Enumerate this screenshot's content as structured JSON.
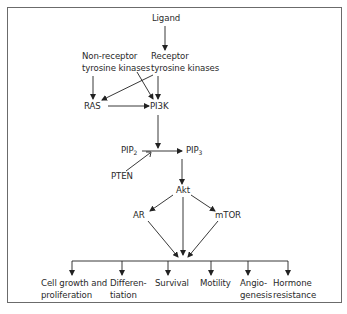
{
  "diagram": {
    "type": "signaling-pathway",
    "nodes": {
      "ligand": "Ligand",
      "non_receptor_tk": [
        "Non-receptor",
        "tyrosine kinases"
      ],
      "receptor_tk": [
        "Receptor",
        "tyrosine kinases"
      ],
      "ras": "RAS",
      "pi3k": "PI3K",
      "pip2": {
        "base": "PIP",
        "sub": "2"
      },
      "pip3": {
        "base": "PIP",
        "sub": "3"
      },
      "pten": "PTEN",
      "akt": "Akt",
      "ar": "AR",
      "mtor": "mTOR"
    },
    "outcomes": [
      {
        "line1": "Cell growth and",
        "line2": "proliferation"
      },
      {
        "line1": "Differen-",
        "line2": "tiation"
      },
      {
        "line1": "Survival",
        "line2": ""
      },
      {
        "line1": "Motility",
        "line2": ""
      },
      {
        "line1": "Angio-",
        "line2": "genesis"
      },
      {
        "line1": "Hormone",
        "line2": "resistance"
      }
    ],
    "edges": [
      [
        "Ligand",
        "Receptor tyrosine kinases"
      ],
      [
        "Non-receptor tyrosine kinases",
        "RAS"
      ],
      [
        "Non-receptor tyrosine kinases",
        "PI3K"
      ],
      [
        "Receptor tyrosine kinases",
        "RAS"
      ],
      [
        "Receptor tyrosine kinases",
        "PI3K"
      ],
      [
        "RAS",
        "PI3K"
      ],
      [
        "PI3K",
        "PIP2→PIP3"
      ],
      [
        "PIP2",
        "PIP3"
      ],
      [
        "PTEN",
        "PIP2→PIP3 (inhibits)"
      ],
      [
        "PIP3",
        "Akt"
      ],
      [
        "Akt",
        "AR"
      ],
      [
        "Akt",
        "mTOR"
      ],
      [
        "Akt",
        "outcomes"
      ],
      [
        "AR",
        "outcomes"
      ],
      [
        "mTOR",
        "outcomes"
      ]
    ]
  }
}
